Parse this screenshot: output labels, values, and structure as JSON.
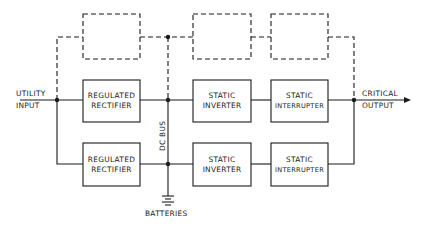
{
  "diagram": {
    "type": "UPS block diagram",
    "labels": {
      "utility_input_line1": "UTILITY",
      "utility_input_line2": "INPUT",
      "critical_output_line1": "CRITICAL",
      "critical_output_line2": "OUTPUT",
      "dc_bus": "DC BUS",
      "batteries": "BATTERIES"
    },
    "rows": [
      {
        "name": "module-1",
        "blocks": [
          {
            "line1": "REGULATED",
            "line2": "RECTIFIER"
          },
          {
            "line1": "STATIC",
            "line2": "INVERTER"
          },
          {
            "line1": "STATIC",
            "line2": "INTERRUPTER"
          }
        ]
      },
      {
        "name": "module-2",
        "blocks": [
          {
            "line1": "REGULATED",
            "line2": "RECTIFIER"
          },
          {
            "line1": "STATIC",
            "line2": "INVERTER"
          },
          {
            "line1": "STATIC",
            "line2": "INTERRUPTER"
          }
        ]
      }
    ],
    "optional_row": {
      "style": "dashed",
      "blocks": 3
    },
    "colors": {
      "line": "#1a1a1a",
      "background": "#ffffff"
    }
  }
}
